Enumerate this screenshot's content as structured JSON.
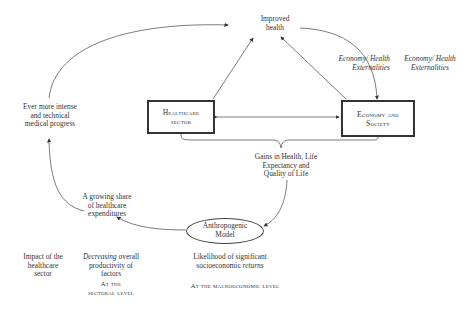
{
  "diagram": {
    "nodes": {
      "improved_health": {
        "line1": "Improved",
        "line2": "health"
      },
      "healthcare_sector": {
        "line1": "Healthcare",
        "line2": "sector"
      },
      "economy_society": {
        "line1": "Economy and",
        "line2": "Society"
      },
      "medical_progress": {
        "line1": "Ever more intense",
        "line2": "and technical",
        "line3": "medical progress"
      },
      "growing_share": {
        "line1": "A growing share",
        "line2": "of healthcare",
        "line3": "expenditures"
      },
      "gains": {
        "line1": "Gains in Health, Life",
        "line2": "Expectancy and",
        "line3": "Quality of Life"
      },
      "anthropogenic": {
        "line1": "Anthropogenic",
        "line2": "Model"
      }
    },
    "edge_labels": {
      "externalities_left": {
        "line1": "Economy/ Health",
        "line2": "Externalities"
      },
      "externalities_right": {
        "line1": "Economy/ Health",
        "line2": "Externalities"
      }
    },
    "footer": {
      "impact": {
        "line1": "Impact of the",
        "line2": "healthcare",
        "line3": "sector"
      },
      "decreasing": {
        "italic": "Decreasing",
        "rest": " overall",
        "line2": "productivity of",
        "line3": "factors"
      },
      "sectoral_level": {
        "line1": "At the",
        "line2": "sectoral level"
      },
      "likelihood": {
        "line1": "Likelihood of significant",
        "line2_prefix": "socioeconomic ",
        "line2_italic": "returns"
      },
      "macro_level": "At the macroeconomic level"
    }
  }
}
